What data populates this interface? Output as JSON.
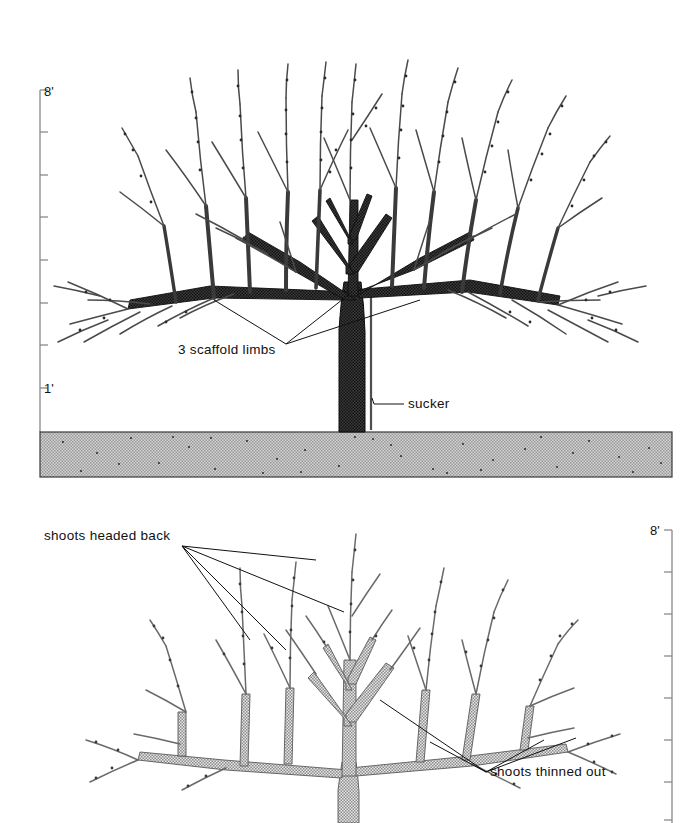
{
  "figure": {
    "background": "#ffffff",
    "ink": "#1a1a1a",
    "soil_fill": "#c9c9c9",
    "soil_speck": "#555555",
    "limb_dark": "#2b2b2b",
    "limb_light": "#9a9a9a",
    "scale_color": "#7a7a7a"
  },
  "panels": [
    {
      "id": "upper",
      "name": "unpruned-tree",
      "scale": {
        "side": "left",
        "top_label": "8'",
        "bottom_label": "1'",
        "ticks": 8,
        "top_y": 90,
        "bottom_y": 388
      },
      "ground": {
        "top_y": 432,
        "bottom_y": 477,
        "left_x": 40,
        "right_x": 672
      },
      "annotations": [
        {
          "name": "scaffold-limbs-label",
          "text": "3 scaffold limbs"
        },
        {
          "name": "sucker-label",
          "text": "sucker"
        }
      ]
    },
    {
      "id": "lower",
      "name": "pruned-tree",
      "scale": {
        "side": "right",
        "top_label": "8'",
        "ticks": 8,
        "top_y": 530,
        "bottom_y": 823
      },
      "annotations": [
        {
          "name": "shoots-headed-back-label",
          "text": "shoots headed back"
        },
        {
          "name": "shoots-thinned-out-label",
          "text": "shoots thinned out"
        }
      ]
    }
  ],
  "labels": {
    "scaffold_limbs": "3 scaffold limbs",
    "sucker": "sucker",
    "shoots_headed_back": "shoots headed back",
    "shoots_thinned_out": "shoots thinned out",
    "scale_top_upper": "8'",
    "scale_bottom_upper": "1'",
    "scale_top_lower": "8'"
  }
}
